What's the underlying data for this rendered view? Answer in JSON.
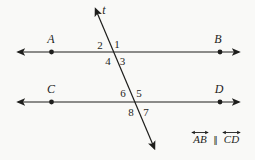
{
  "figure": {
    "background_color": "#f9f9f7",
    "ink_color": "#1e1e1c",
    "transversal_label": "t",
    "points": [
      {
        "label": "A"
      },
      {
        "label": "B"
      },
      {
        "label": "C"
      },
      {
        "label": "D"
      }
    ],
    "angles": [
      {
        "number": "1"
      },
      {
        "number": "2"
      },
      {
        "number": "3"
      },
      {
        "number": "4"
      },
      {
        "number": "5"
      },
      {
        "number": "6"
      },
      {
        "number": "7"
      },
      {
        "number": "8"
      }
    ],
    "statement": {
      "left": "AB",
      "parallel_symbol": "∥",
      "right": "CD"
    }
  }
}
